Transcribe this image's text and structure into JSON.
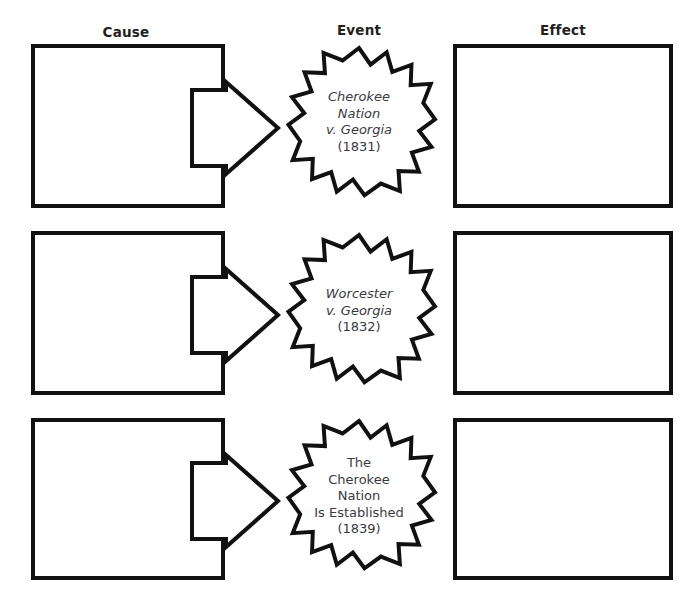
{
  "diagram": {
    "type": "cause-event-effect-organizer",
    "columns": [
      {
        "id": "cause",
        "label": "Cause"
      },
      {
        "id": "event",
        "label": "Event"
      },
      {
        "id": "effect",
        "label": "Effect"
      }
    ],
    "colors": {
      "stroke": "#111111",
      "fill": "#ffffff",
      "header_text": "#231f20",
      "star_text": "#3a3a42",
      "background": "#ffffff"
    },
    "rows": [
      {
        "cause_text": "",
        "effect_text": "",
        "event": {
          "lines": [
            {
              "text": "Cherokee",
              "style": "italic"
            },
            {
              "text": "Nation",
              "style": "italic"
            },
            {
              "text": "v. Georgia",
              "style": "italic"
            }
          ],
          "year": "(1831)"
        }
      },
      {
        "cause_text": "",
        "effect_text": "",
        "event": {
          "lines": [
            {
              "text": "Worcester",
              "style": "italic"
            },
            {
              "text": "v. Georgia",
              "style": "italic"
            }
          ],
          "year": "(1832)"
        }
      },
      {
        "cause_text": "",
        "effect_text": "",
        "event": {
          "lines": [
            {
              "text": "The",
              "style": "normal"
            },
            {
              "text": "Cherokee",
              "style": "normal"
            },
            {
              "text": "Nation",
              "style": "normal"
            },
            {
              "text": "Is Established",
              "style": "normal"
            }
          ],
          "year": "(1839)"
        }
      }
    ]
  },
  "icons": {
    "arrow": "right-arrow-icon",
    "star": "starburst-icon"
  }
}
